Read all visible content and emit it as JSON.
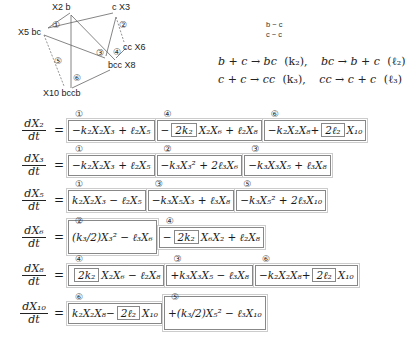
{
  "diagram": {
    "nodes": [
      {
        "id": "X2",
        "label": "X2  b"
      },
      {
        "id": "X3",
        "label": "c  X3"
      },
      {
        "id": "X5",
        "label": "X5  bc"
      },
      {
        "id": "X6",
        "label": "cc  X6"
      },
      {
        "id": "X8",
        "label": "bcc  X8"
      },
      {
        "id": "X10",
        "label": "X10  bccb"
      }
    ],
    "reaction_markers": [
      "①",
      "②",
      "③",
      "④",
      "⑤",
      "⑥"
    ]
  },
  "legend": {
    "line1": "b − c",
    "line2": "c − c"
  },
  "reactions": {
    "r1": "b + c → bc",
    "r1_rate": "(k₂),",
    "r1_rev": "bc → b + c",
    "r1_rev_rate": "(ℓ₂)",
    "r2": "c + c → cc",
    "r2_rate": "(k₃),",
    "r2_rev": "cc → c + c",
    "r2_rev_rate": "(ℓ₃)"
  },
  "equations": [
    {
      "lhs_num": "dX₂",
      "lhs_den": "dt",
      "terms": [
        {
          "tag": "①",
          "text": "−k₂X₂X₃ + ℓ₂X₅"
        },
        {
          "tag": "④",
          "pre": "−",
          "boxed": "2k₂",
          "post": "X₂X₆ + ℓ₂X₈"
        },
        {
          "tag": "⑥",
          "pre": "−k₂X₂X₈+",
          "boxed": "2ℓ₂",
          "post": "X₁₀"
        }
      ]
    },
    {
      "lhs_num": "dX₃",
      "lhs_den": "dt",
      "terms": [
        {
          "tag": "①",
          "text": "−k₂X₂X₃ + ℓ₂X₅"
        },
        {
          "tag": "②",
          "text": "−k₃X₃² + 2ℓ₃X₆"
        },
        {
          "tag": "③",
          "text": "−k₃X₃X₅ + ℓ₃X₈"
        }
      ]
    },
    {
      "lhs_num": "dX₅",
      "lhs_den": "dt",
      "terms": [
        {
          "tag": "①",
          "text": "k₂X₂X₃ − ℓ₂X₅"
        },
        {
          "tag": "③",
          "text": "−k₃X₅X₃ + ℓ₃X₈"
        },
        {
          "tag": "⑤",
          "text": "−k₃X₅² + 2ℓ₃X₁₀"
        }
      ]
    },
    {
      "lhs_num": "dX₆",
      "lhs_den": "dt",
      "terms": [
        {
          "tag": "②",
          "text": "(k₃/2)X₃² − ℓ₃X₆"
        },
        {
          "tag": "④",
          "pre": "−",
          "boxed": "2k₂",
          "post": "X₆X₂ + ℓ₂X₈"
        }
      ]
    },
    {
      "lhs_num": "dX₈",
      "lhs_den": "dt",
      "terms": [
        {
          "tag": "④",
          "pre": "",
          "boxed": "2k₂",
          "post": "X₂X₆ − ℓ₂X₈"
        },
        {
          "tag": "③",
          "text": "+k₃X₃X₅ − ℓ₃X₈"
        },
        {
          "tag": "⑥",
          "pre": "−k₂X₂X₈+",
          "boxed": "2ℓ₂",
          "post": "X₁₀"
        }
      ]
    },
    {
      "lhs_num": "dX₁₀",
      "lhs_den": "dt",
      "terms": [
        {
          "tag": "⑥",
          "pre": "k₂X₂X₈−",
          "boxed": "2ℓ₂",
          "post": "X₁₀"
        },
        {
          "tag": "⑤",
          "text": "+(k₃/2)X₅² − ℓ₃X₁₀"
        }
      ]
    }
  ]
}
